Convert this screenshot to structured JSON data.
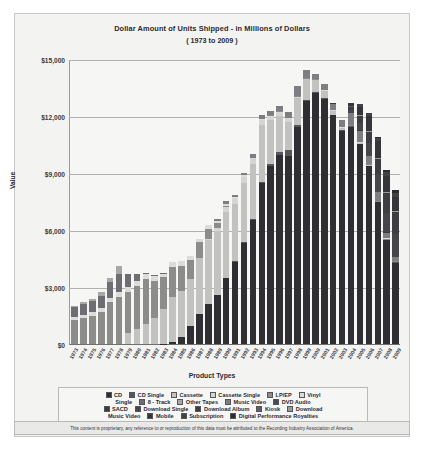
{
  "chart_title": "Dollar Amount of Units Shipped - in Millions of Dollars",
  "chart_subtitle": "( 1973 to 2009 )",
  "axis": {
    "y_title": "Value",
    "x_title": "Product Types",
    "y_ticks": [
      "$0",
      "$3,000",
      "$6,000",
      "$9,000",
      "$12,000",
      "$15,000"
    ]
  },
  "legend": {
    "rows": [
      [
        {
          "label": "CD",
          "color": "#2f2f33"
        },
        {
          "label": "CD Single",
          "color": "#55555a"
        },
        {
          "label": "Cassette",
          "color": "#c2c2c0"
        },
        {
          "label": "Cassette Single",
          "color": "#d5d5d3"
        },
        {
          "label": "LP/EP",
          "color": "#8c8c8a"
        },
        {
          "label": "Vinyl",
          "color": "#dcdcda"
        }
      ],
      [
        {
          "label": "Single",
          "color": null
        },
        {
          "label": "8 - Track",
          "color": "#6e6e72"
        },
        {
          "label": "Other Tapes",
          "color": "#a8a8a6"
        },
        {
          "label": "Music Video",
          "color": "#7e7e82"
        },
        {
          "label": "DVD Audio",
          "color": "#4a4a4e"
        }
      ],
      [
        {
          "label": "SACD",
          "color": "#3a3a3e"
        },
        {
          "label": "Download Single",
          "color": "#46464a"
        },
        {
          "label": "Download Album",
          "color": "#3e3e42"
        },
        {
          "label": "Kiosk",
          "color": "#5e5e62"
        },
        {
          "label": "Download",
          "color": "#9a9a98"
        }
      ],
      [
        {
          "label": "Music Video",
          "color": null
        },
        {
          "label": "Mobile",
          "color": "#35353a"
        },
        {
          "label": "Subscription",
          "color": "#424246"
        },
        {
          "label": "Digital Performance Royalties",
          "color": "#2b2b30"
        }
      ]
    ]
  },
  "footer_text": "This content is proprietary, any reference to or reproduction of this data must be attributed to the Recording Industry Association of America.",
  "chart_data": {
    "type": "bar",
    "stacked": true,
    "title": "Dollar Amount of Units Shipped - in Millions of Dollars",
    "subtitle": "( 1973 to 2009 )",
    "xlabel": "Product Types",
    "ylabel": "Value",
    "ylim": [
      0,
      15000
    ],
    "yticks": [
      0,
      3000,
      6000,
      9000,
      12000,
      15000
    ],
    "grid": true,
    "legend_position": "bottom",
    "categories": [
      "1973",
      "1974",
      "1975",
      "1976",
      "1977",
      "1978",
      "1979",
      "1980",
      "1981",
      "1982",
      "1983",
      "1984",
      "1985",
      "1986",
      "1987",
      "1988",
      "1989",
      "1990",
      "1991",
      "1992",
      "1993",
      "1994",
      "1995",
      "1996",
      "1997",
      "1998",
      "1999",
      "2000",
      "2001",
      "2002",
      "2003",
      "2004",
      "2005",
      "2006",
      "2007",
      "2008",
      "2009"
    ],
    "totals": [
      2000,
      2200,
      2380,
      2740,
      3500,
      4130,
      3690,
      3680,
      3630,
      3590,
      3790,
      4370,
      4390,
      4650,
      5570,
      6250,
      6580,
      7540,
      7830,
      9020,
      10050,
      12070,
      12320,
      12530,
      12240,
      13720,
      14580,
      14320,
      13740,
      12610,
      11850,
      12150,
      12270,
      11760,
      10370,
      8480,
      7700
    ],
    "series": [
      {
        "name": "CD",
        "color": "#2f2f33",
        "values": [
          0,
          0,
          0,
          0,
          0,
          0,
          0,
          0,
          0,
          0,
          17,
          103,
          389,
          930,
          1593,
          2089,
          2587,
          3452,
          4338,
          5326,
          6511,
          8465,
          9377,
          9935,
          9915,
          11416,
          12816,
          13215,
          12909,
          12044,
          11233,
          11447,
          10520,
          9373,
          7452,
          5471,
          4272
        ]
      },
      {
        "name": "CD Single",
        "color": "#55555a",
        "values": [
          0,
          0,
          0,
          0,
          0,
          0,
          0,
          0,
          0,
          0,
          0,
          0,
          0,
          0,
          0,
          0,
          0,
          6,
          36,
          45,
          46,
          82,
          110,
          184,
          272,
          95,
          48,
          43,
          20,
          20,
          20,
          16,
          10,
          9,
          6,
          4,
          3
        ]
      },
      {
        "name": "Cassette",
        "color": "#c2c2c0",
        "values": [
          0,
          0,
          0,
          0,
          0,
          0,
          604,
          776,
          1063,
          1385,
          1810,
          2384,
          2412,
          2500,
          2960,
          3385,
          3346,
          3472,
          3020,
          3116,
          2916,
          2976,
          2304,
          1905,
          1523,
          1420,
          1062,
          626,
          363,
          209,
          108,
          24,
          11,
          4,
          3,
          0,
          0
        ]
      },
      {
        "name": "Cassette Single",
        "color": "#d5d5d3",
        "values": [
          0,
          0,
          0,
          0,
          0,
          0,
          0,
          0,
          0,
          0,
          0,
          0,
          0,
          0,
          0,
          57,
          194,
          257,
          230,
          298,
          298,
          274,
          236,
          189,
          125,
          94,
          48,
          14,
          5,
          2,
          0,
          0,
          0,
          0,
          0,
          0,
          0
        ]
      },
      {
        "name": "LP/EP",
        "color": "#8c8c8a",
        "values": [
          1246,
          1356,
          1485,
          1663,
          2195,
          2473,
          2136,
          2290,
          2341,
          1925,
          1689,
          1549,
          1281,
          983,
          793,
          532,
          220,
          87,
          29,
          13,
          10,
          18,
          25,
          37,
          34,
          34,
          31,
          27,
          22,
          20,
          21,
          19,
          27,
          36,
          23,
          57,
          56
        ]
      },
      {
        "name": "Vinyl Single",
        "color": "#dcdcda",
        "values": [
          190,
          194,
          211,
          245,
          245,
          260,
          275,
          269,
          256,
          283,
          187,
          298,
          281,
          228,
          203,
          180,
          116,
          94,
          63,
          66,
          11,
          18,
          14,
          10,
          9,
          6,
          6,
          4,
          4,
          3,
          2,
          2,
          2,
          2,
          4,
          3,
          4
        ]
      },
      {
        "name": "8 - Track",
        "color": "#6e6e72",
        "values": [
          489,
          549,
          583,
          646,
          811,
          948,
          669,
          325,
          78,
          20,
          6,
          0,
          0,
          0,
          0,
          0,
          0,
          0,
          0,
          0,
          0,
          0,
          0,
          0,
          0,
          0,
          0,
          0,
          0,
          0,
          0,
          0,
          0,
          0,
          0,
          0,
          0
        ]
      },
      {
        "name": "Other Tapes",
        "color": "#a8a8a6",
        "values": [
          75,
          101,
          101,
          186,
          249,
          449,
          6,
          0,
          0,
          0,
          0,
          0,
          0,
          0,
          0,
          0,
          0,
          0,
          0,
          0,
          0,
          0,
          0,
          0,
          0,
          0,
          0,
          0,
          0,
          0,
          0,
          0,
          0,
          0,
          0,
          0,
          0
        ]
      },
      {
        "name": "Music Video",
        "color": "#7e7e82",
        "values": [
          0,
          0,
          0,
          0,
          0,
          0,
          0,
          0,
          0,
          0,
          0,
          0,
          0,
          0,
          0,
          0,
          115,
          172,
          118,
          157,
          213,
          231,
          220,
          236,
          323,
          508,
          376,
          281,
          329,
          288,
          369,
          607,
          602,
          451,
          484,
          274,
          193
        ]
      },
      {
        "name": "DVD Audio",
        "color": "#4a4a4e",
        "values": [
          0,
          0,
          0,
          0,
          0,
          0,
          0,
          0,
          0,
          0,
          0,
          0,
          0,
          0,
          0,
          0,
          0,
          0,
          0,
          0,
          0,
          0,
          0,
          0,
          0,
          0,
          0,
          0,
          13,
          9,
          9,
          9,
          6,
          4,
          3,
          2,
          1
        ]
      },
      {
        "name": "SACD",
        "color": "#3a3a3e",
        "values": [
          0,
          0,
          0,
          0,
          0,
          0,
          0,
          0,
          0,
          0,
          0,
          0,
          0,
          0,
          0,
          0,
          0,
          0,
          0,
          0,
          0,
          0,
          0,
          0,
          0,
          0,
          0,
          0,
          0,
          15,
          9,
          9,
          5,
          3,
          2,
          1,
          1
        ]
      },
      {
        "name": "Download Single",
        "color": "#46464a",
        "values": [
          0,
          0,
          0,
          0,
          0,
          0,
          0,
          0,
          0,
          0,
          0,
          0,
          0,
          0,
          0,
          0,
          0,
          0,
          0,
          0,
          0,
          0,
          0,
          0,
          0,
          0,
          0,
          0,
          0,
          0,
          0,
          136,
          363,
          636,
          868,
          1033,
          1163
        ]
      },
      {
        "name": "Download Album",
        "color": "#3e3e42",
        "values": [
          0,
          0,
          0,
          0,
          0,
          0,
          0,
          0,
          0,
          0,
          0,
          0,
          0,
          0,
          0,
          0,
          0,
          0,
          0,
          0,
          0,
          0,
          0,
          0,
          0,
          0,
          0,
          0,
          0,
          0,
          0,
          183,
          386,
          566,
          807,
          1037,
          1170
        ]
      },
      {
        "name": "Kiosk",
        "color": "#5e5e62",
        "values": [
          0,
          0,
          0,
          0,
          0,
          0,
          0,
          0,
          0,
          0,
          0,
          0,
          0,
          0,
          0,
          0,
          0,
          0,
          0,
          0,
          0,
          0,
          0,
          0,
          0,
          0,
          0,
          0,
          0,
          0,
          0,
          1,
          2,
          3,
          3,
          2,
          2
        ]
      },
      {
        "name": "Download Music Video",
        "color": "#9a9a98",
        "values": [
          0,
          0,
          0,
          0,
          0,
          0,
          0,
          0,
          0,
          0,
          0,
          0,
          0,
          0,
          0,
          0,
          0,
          0,
          0,
          0,
          0,
          0,
          0,
          0,
          0,
          0,
          0,
          0,
          0,
          0,
          0,
          3,
          10,
          20,
          26,
          28,
          28
        ]
      },
      {
        "name": "Mobile",
        "color": "#35353a",
        "values": [
          0,
          0,
          0,
          0,
          0,
          0,
          0,
          0,
          0,
          0,
          0,
          0,
          0,
          0,
          0,
          0,
          0,
          0,
          0,
          0,
          0,
          0,
          0,
          0,
          0,
          0,
          0,
          0,
          0,
          0,
          0,
          150,
          421,
          773,
          880,
          866,
          750
        ]
      },
      {
        "name": "Subscription",
        "color": "#424246",
        "values": [
          0,
          0,
          0,
          0,
          0,
          0,
          0,
          0,
          0,
          0,
          0,
          0,
          0,
          0,
          0,
          0,
          0,
          0,
          0,
          0,
          0,
          0,
          0,
          0,
          0,
          0,
          0,
          0,
          0,
          0,
          0,
          0,
          149,
          207,
          201,
          212,
          216
        ]
      },
      {
        "name": "Digital Performance Royalties",
        "color": "#2b2b30",
        "values": [
          0,
          0,
          0,
          0,
          0,
          0,
          0,
          0,
          0,
          0,
          0,
          0,
          0,
          0,
          0,
          0,
          0,
          0,
          0,
          0,
          0,
          0,
          0,
          0,
          0,
          0,
          0,
          0,
          0,
          0,
          0,
          0,
          0,
          0,
          50,
          95,
          155
        ]
      }
    ]
  }
}
